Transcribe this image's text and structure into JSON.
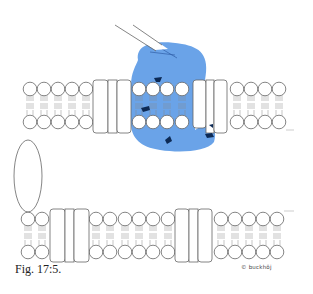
{
  "figure": {
    "caption": "Fig. 17:5.",
    "credit": "© buckhöj",
    "colors": {
      "protein_blue": "#6aa3e8",
      "mark_dark": "#0d2a55",
      "outline": "#666666"
    },
    "elements": [
      {
        "id": "upper-membrane",
        "type": "lipid-bilayer",
        "lipids_left": 5,
        "lipids_in_protein": 4,
        "lipids_right": 4,
        "protein_blocks": 2
      },
      {
        "id": "lower-membrane",
        "type": "lipid-bilayer",
        "lipids": 13,
        "protein_blocks": 2
      },
      {
        "id": "blue-protein",
        "type": "highlighted-protein-blob",
        "dark_marks": 5
      },
      {
        "id": "micropipette",
        "type": "needle"
      },
      {
        "id": "oval-cell",
        "type": "ellipse"
      }
    ]
  }
}
